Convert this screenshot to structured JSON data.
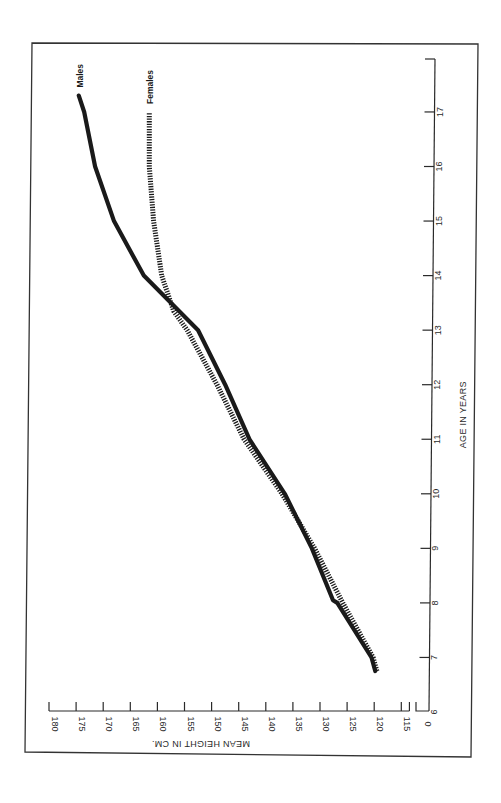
{
  "chart_data": {
    "type": "line",
    "orientation": "rotated 90° clockwise (age axis vertical on right, height axis horizontal at bottom)",
    "title": "",
    "xlabel": "AGE IN YEARS",
    "ylabel": "MEAN HEIGHT IN CM.",
    "x_ticks": [
      "6",
      "7",
      "8",
      "9",
      "10",
      "11",
      "12",
      "13",
      "14",
      "15",
      "16",
      "17"
    ],
    "y_ticks": [
      "0",
      "115",
      "120",
      "125",
      "130",
      "135",
      "140",
      "145",
      "150",
      "155",
      "160",
      "165",
      "170",
      "175",
      "180"
    ],
    "xlim": [
      6,
      17.5
    ],
    "ylim": [
      0,
      180
    ],
    "y_axis_break": "between 0 and 115",
    "grid": false,
    "legend": "direct labels at line ends",
    "series": [
      {
        "name": "Males",
        "style": "solid thick",
        "color": "#1a1a1a",
        "x": [
          6.75,
          7,
          8,
          8.05,
          9,
          10,
          11,
          12,
          13,
          14,
          15,
          16,
          17,
          17.3
        ],
        "values": [
          119.8,
          120.5,
          126.8,
          127.6,
          131.5,
          136.5,
          143,
          147.5,
          152.5,
          162.5,
          168,
          171.5,
          173.5,
          174.5
        ]
      },
      {
        "name": "Females",
        "style": "dotted thick",
        "color": "#1a1a1a",
        "x": [
          6.75,
          7,
          8,
          9,
          10,
          11,
          12,
          13,
          13.35,
          14,
          15,
          16,
          17
        ],
        "values": [
          119.5,
          120.2,
          125.8,
          131,
          137,
          144,
          149,
          154.5,
          157,
          159.2,
          160.7,
          161.5,
          161.5
        ]
      }
    ]
  },
  "colors": {
    "line": "#1a1a1a",
    "axis": "#2a2a2a",
    "background": "#ffffff"
  }
}
